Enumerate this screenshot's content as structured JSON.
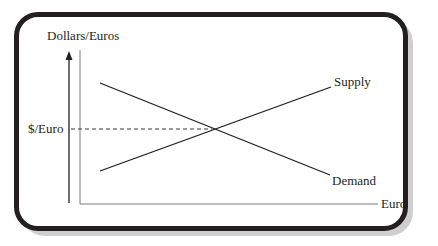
{
  "diagram": {
    "type": "supply-demand",
    "title": "",
    "y_axis_label": "Dollars/Euros",
    "x_axis_label": "Euro",
    "equilibrium_label": "$/Euro",
    "curves": [
      {
        "name": "Supply",
        "label": "Supply",
        "direction": "upward-sloping"
      },
      {
        "name": "Demand",
        "label": "Demand",
        "direction": "downward-sloping"
      }
    ],
    "colors": {
      "line": "#231f20",
      "frame": "#231f20",
      "frame_shadow": "#cfcfcf",
      "axis": "#6d6e71",
      "background": "#ffffff"
    }
  }
}
